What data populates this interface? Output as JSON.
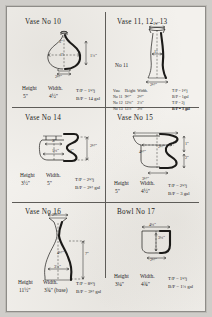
{
  "sheet": {
    "kind": "handwritten pottery throwing chart",
    "panels": [
      {
        "id": "panel-vase-10",
        "title": "Vase  No 10",
        "height_label": "Height",
        "height_value": "5\"",
        "width_label": "Width.",
        "width_value": "4½\"",
        "note_1": "T/P = 1½j",
        "note_2": "B/P = 14 gal",
        "dims": [
          "3\"",
          "1\"",
          "1¾\"",
          "2½\""
        ]
      },
      {
        "id": "panel-vase-11-12-13",
        "title": "Vase  11, 12 , 13",
        "sublabel": "No 11",
        "dims": [
          "1½\"",
          "1\"",
          "2½\""
        ],
        "table": {
          "columns": [
            "Vase",
            "Height",
            "Width."
          ],
          "rows": [
            [
              "No 11",
              "9½\"",
              "2½\""
            ],
            [
              "No 12",
              "12¼\"",
              "2¾\""
            ],
            [
              "No 13",
              "13¾\"",
              "3¼\""
            ]
          ]
        },
        "notes": [
          "T/P  =  1½j",
          "B/P  =  1gal",
          "T/P  =  2j",
          "B/P  =  3 gal"
        ]
      },
      {
        "id": "panel-vase-14",
        "title": "Vase  No 14",
        "height_label": "Height",
        "height_value": "3½\"",
        "width_label": "Width.",
        "width_value": "5\"",
        "note_1": "T/P = 2½j",
        "note_2": "B/P = 2½ gal",
        "dims": [
          "2\"",
          "1¼\"",
          "1\"",
          "2½\""
        ]
      },
      {
        "id": "panel-vase-15",
        "title": "Vase  No 15",
        "height_label": "Height",
        "height_value": "5\"",
        "width_label": "Width.",
        "width_value": "4½\"",
        "note_1": "T/P = 2½j",
        "note_2": "B/P = 3 gal",
        "dims": [
          "4½\"",
          "2½\"",
          "3½\"",
          "1\"",
          "2\""
        ]
      },
      {
        "id": "panel-vase-16",
        "title": "Vase  No 16",
        "height_label": "Height",
        "height_value": "11½\"",
        "width_label": "Width.",
        "width_value": "3¾\" (base)",
        "note_1": "T/P = 8½j",
        "note_2": "B/P = 3½ gal",
        "dims": [
          "2½\"",
          "4½\"",
          "3¾\"",
          "7\""
        ]
      },
      {
        "id": "panel-bowl-17",
        "title": "Bowl  No 17",
        "height_label": "Height",
        "height_value": "3¼\"",
        "width_label": "Width.",
        "width_value": "4¾\"",
        "note_1": "T/P = 1½j",
        "note_2": "B/P = 1¾ gal",
        "dims": [
          "4¼\"",
          "3¼\"",
          "2½\""
        ]
      }
    ],
    "colors": {
      "paper": "#f3f1ed",
      "ink": "#1b1a18",
      "rule": "#5e5c58",
      "backdrop": "#cfcdc9"
    }
  }
}
